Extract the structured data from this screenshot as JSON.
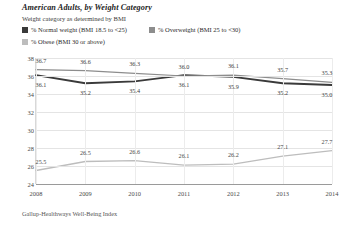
{
  "header": {
    "title": "American Adults, by Weight Category",
    "subtitle": "Weight category as determined by BMI"
  },
  "footer": {
    "source": "Gallup-Healthways Well-Being Index"
  },
  "legend": {
    "items": [
      {
        "label": "% Normal weight (BMI 18.5 to <25)",
        "color": "#3a3a3a"
      },
      {
        "label": "% Overweight (BMI 25 to <30)",
        "color": "#8d8d8d"
      },
      {
        "label": "% Obese (BMI 30 or above)",
        "color": "#bdbdbd"
      }
    ]
  },
  "chart_data": {
    "type": "line",
    "title": "American Adults, by Weight Category",
    "subtitle": "Weight category as determined by BMI",
    "xlabel": "",
    "ylabel": "",
    "categories": [
      "2008",
      "2009",
      "2010",
      "2011",
      "2012",
      "2013",
      "2014"
    ],
    "yticks": [
      24,
      26,
      28,
      30,
      32,
      34,
      36,
      38
    ],
    "ylim": [
      24,
      38
    ],
    "grid": true,
    "legend_position": "top",
    "series": [
      {
        "name": "% Normal weight (BMI 18.5 to <25)",
        "color": "#3a3a3a",
        "values": [
          36.1,
          35.2,
          35.4,
          36.1,
          35.9,
          35.2,
          35.0
        ]
      },
      {
        "name": "% Overweight (BMI 25 to <30)",
        "color": "#8d8d8d",
        "values": [
          36.7,
          36.6,
          36.3,
          36.0,
          36.1,
          35.7,
          35.3
        ]
      },
      {
        "name": "% Obese (BMI 30 or above)",
        "color": "#bdbdbd",
        "values": [
          25.5,
          26.5,
          26.6,
          26.1,
          26.2,
          27.1,
          27.7
        ]
      }
    ]
  }
}
